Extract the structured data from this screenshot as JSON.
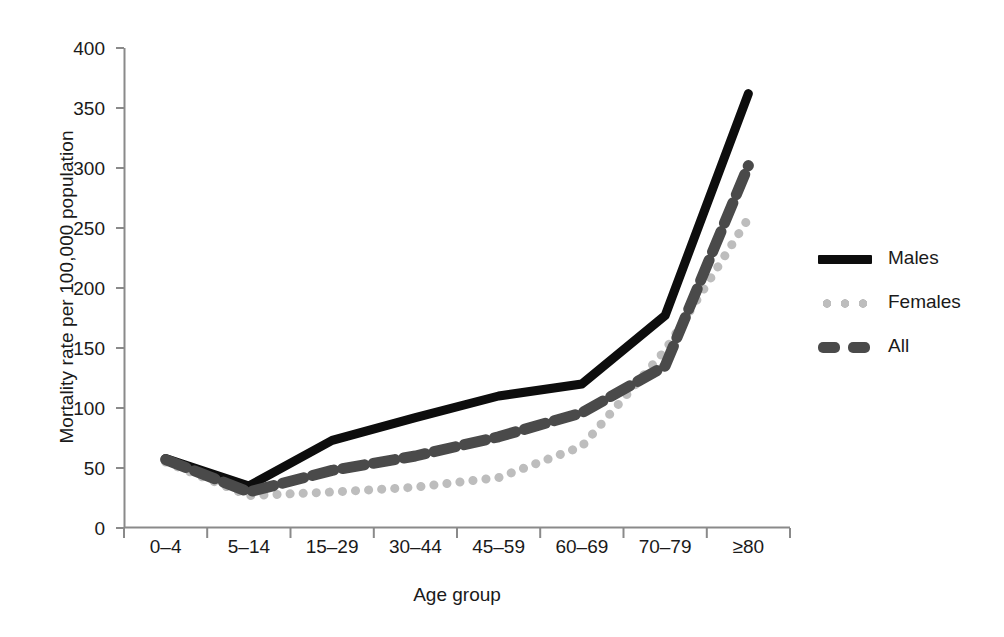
{
  "chart_data": {
    "type": "line",
    "title": "",
    "xlabel": "Age group",
    "ylabel": "Mortality rate per 100,000 population",
    "categories": [
      "0–4",
      "5–14",
      "15–29",
      "30–44",
      "45–59",
      "60–69",
      "70–79",
      "≥80"
    ],
    "yticks": [
      0,
      50,
      100,
      150,
      200,
      250,
      300,
      350,
      400
    ],
    "ylim": [
      0,
      400
    ],
    "grid": false,
    "legend_position": "right",
    "series": [
      {
        "name": "Males",
        "style": "solid",
        "color": "#0d0d0d",
        "values": [
          58,
          35,
          73,
          92,
          110,
          120,
          177,
          362
        ]
      },
      {
        "name": "Females",
        "style": "dotted",
        "color": "#bdbdbd",
        "values": [
          55,
          27,
          30,
          34,
          42,
          68,
          148,
          258
        ]
      },
      {
        "name": "All",
        "style": "dashed",
        "color": "#4a4a4a",
        "values": [
          57,
          30,
          48,
          60,
          76,
          96,
          135,
          302
        ]
      }
    ]
  },
  "axis": {
    "tick_0": "0",
    "tick_50": "50",
    "tick_100": "100",
    "tick_150": "150",
    "tick_200": "200",
    "tick_250": "250",
    "tick_300": "300",
    "tick_350": "350",
    "tick_400": "400"
  },
  "legend": {
    "males_label": "Males",
    "females_label": "Females",
    "all_label": "All"
  },
  "colors": {
    "males": "#0d0d0d",
    "females": "#bdbdbd",
    "all": "#4a4a4a",
    "axis": "#8a8a8a",
    "text": "#1a1a1a"
  }
}
